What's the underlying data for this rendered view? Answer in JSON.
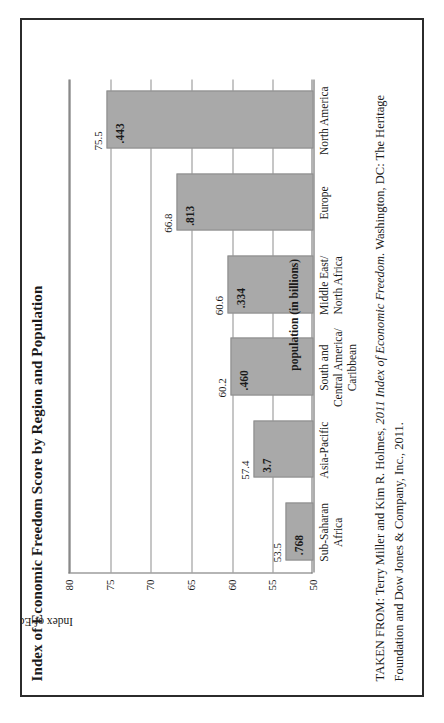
{
  "figure": {
    "title": "Index of Economic Freedom Score by Region and Population",
    "source_prefix": "TAKEN FROM:",
    "source_text_a": " Terry Miller and Kim R. Holmes, ",
    "source_italic": "2011 Index of Economic Freedom",
    "source_text_b": ". Washington, DC: The Heritage Foundation and Dow Jones & Company, Inc., 2011.",
    "annotation": "population (in billions)"
  },
  "chart_data": {
    "type": "bar",
    "title": "Index of Economic Freedom Score by Region and Population",
    "xlabel": "",
    "ylabel": "Index of Economic Freedom Score",
    "ylim": [
      50,
      80
    ],
    "yticks": [
      50,
      55,
      60,
      65,
      70,
      75,
      80
    ],
    "ytick_labels": [
      "50",
      "55",
      "60",
      "65",
      "70",
      "75",
      "80"
    ],
    "grid": true,
    "legend": false,
    "orientation": "vertical",
    "baseline": 50,
    "annotation": "population (in billions)",
    "categories": [
      "Sub-Saharan Africa",
      "Asia-Pacific",
      "South and Central America/Caribbean",
      "Middle East/North Africa",
      "Europe",
      "North America"
    ],
    "category_lines": [
      [
        "Sub-Saharan",
        "Africa"
      ],
      [
        "Asia-Pacific"
      ],
      [
        "South and",
        "Central America/",
        "Caribbean"
      ],
      [
        "Middle East/",
        "North Africa"
      ],
      [
        "Europe"
      ],
      [
        "North America"
      ]
    ],
    "series": [
      {
        "name": "Index of Economic Freedom Score",
        "values": [
          53.5,
          57.4,
          60.2,
          60.6,
          66.8,
          75.5
        ],
        "labels": [
          "53.5",
          "57.4",
          "60.2",
          "60.6",
          "66.8",
          "75.5"
        ]
      },
      {
        "name": "population (in billions)",
        "values": [
          0.768,
          3.7,
          0.46,
          0.334,
          0.813,
          0.443
        ],
        "labels": [
          ".768",
          "3.7",
          ".460",
          ".334",
          ".813",
          ".443"
        ]
      }
    ]
  }
}
